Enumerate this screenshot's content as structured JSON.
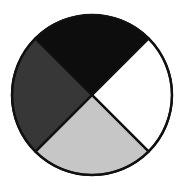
{
  "figure": {
    "background_color": "#ffffff",
    "outline_color": "#111111",
    "outline_width": 2.2,
    "center_x": 92,
    "center_y": 95,
    "radius": 80
  },
  "chart_data": {
    "type": "pie",
    "subtitle": "",
    "xlabel": "",
    "ylabel": "",
    "grid": false,
    "legend_position": "none",
    "center": [
      92,
      95
    ],
    "radius": 80,
    "start_angle_deg": 45,
    "direction": "clockwise",
    "total_segments": 4,
    "categories": [
      "Top",
      "Right",
      "Bottom",
      "Left"
    ],
    "values": [
      25,
      25,
      25,
      25
    ],
    "labels": [],
    "segments": [
      {
        "name": "Top",
        "position": "top",
        "value": 25,
        "unit": "percent",
        "sweep_deg": 90,
        "start_angle_deg": 225,
        "end_angle_deg": 315,
        "fill": "#0d0d0d",
        "fill_name": "black",
        "stroke": "#111111"
      },
      {
        "name": "Right",
        "position": "right",
        "value": 25,
        "unit": "percent",
        "sweep_deg": 90,
        "start_angle_deg": 315,
        "end_angle_deg": 45,
        "fill": "#ffffff",
        "fill_name": "white",
        "stroke": "#111111"
      },
      {
        "name": "Bottom",
        "position": "bottom",
        "value": 25,
        "unit": "percent",
        "sweep_deg": 90,
        "start_angle_deg": 45,
        "end_angle_deg": 135,
        "fill": "#c6c6c6",
        "fill_name": "light gray",
        "stroke": "#111111"
      },
      {
        "name": "Left",
        "position": "left",
        "value": 25,
        "unit": "percent",
        "sweep_deg": 90,
        "start_angle_deg": 135,
        "end_angle_deg": 225,
        "fill": "#373737",
        "fill_name": "dark gray",
        "stroke": "#111111"
      }
    ]
  }
}
